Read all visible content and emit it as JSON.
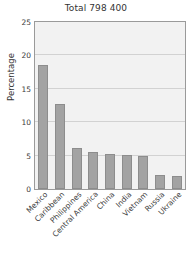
{
  "chart_data": {
    "type": "bar",
    "title": "Total 798 400",
    "xlabel": "",
    "ylabel": "Percentage",
    "ylim": [
      0,
      25
    ],
    "yticks": [
      0,
      5,
      10,
      15,
      20,
      25
    ],
    "grid": true,
    "legend": "none",
    "categories": [
      "Mexico",
      "Caribbean",
      "Philippines",
      "Central America",
      "China",
      "India",
      "Vietnam",
      "Russia",
      "Ukraine"
    ],
    "values": [
      18.5,
      12.8,
      6.1,
      5.5,
      5.2,
      5.1,
      5.0,
      2.1,
      2.0
    ],
    "bar_color": "#a3a3a3",
    "plot_background": "#f2f2f2",
    "gridline_color": "#d2d2d2",
    "axis_color": "#9a9a9a"
  }
}
